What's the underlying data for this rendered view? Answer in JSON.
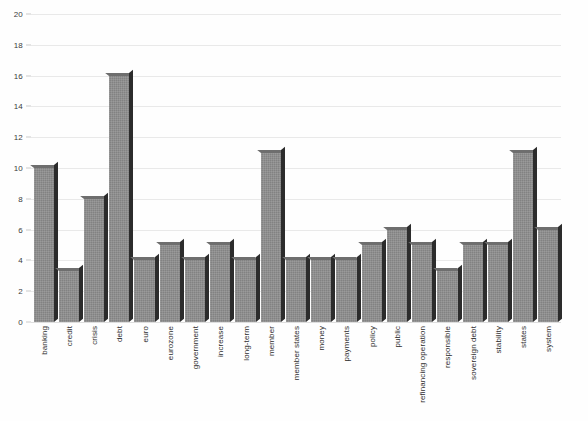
{
  "chart_data": {
    "type": "bar",
    "title": "",
    "subtitle": "",
    "xlabel": "",
    "ylabel": "",
    "ylim": [
      0,
      20
    ],
    "ytick_step": 2,
    "yticks": [
      0,
      2,
      4,
      6,
      8,
      10,
      12,
      14,
      16,
      18,
      20
    ],
    "grid": true,
    "legend": false,
    "legend_position": "none",
    "orientation": "vertical",
    "bar_style": "3d-shadow",
    "xtick_rotation": -90,
    "categories": [
      "banking",
      "credit",
      "crisis",
      "debt",
      "euro",
      "eurozone",
      "government",
      "increase",
      "long-term",
      "member",
      "member states",
      "money",
      "payments",
      "policy",
      "public",
      "refinancing operation",
      "responsible",
      "sovereign debt",
      "stability",
      "states",
      "system"
    ],
    "values": [
      10,
      3.3,
      8,
      16,
      4,
      5,
      4,
      5,
      4,
      11,
      4,
      4,
      4,
      5,
      6,
      5,
      3.3,
      5,
      5,
      11,
      6
    ],
    "series": [
      {
        "name": "frequency",
        "values": [
          10,
          3.3,
          8,
          16,
          4,
          5,
          4,
          5,
          4,
          11,
          4,
          4,
          4,
          5,
          6,
          5,
          3.3,
          5,
          5,
          11,
          6
        ]
      }
    ]
  },
  "colors": {
    "bar_fill": "#828282",
    "bar_shadow": "#2c2c2c",
    "gridline": "#e9e9e9",
    "background": "#fefefe",
    "text": "#2e2e2e"
  }
}
